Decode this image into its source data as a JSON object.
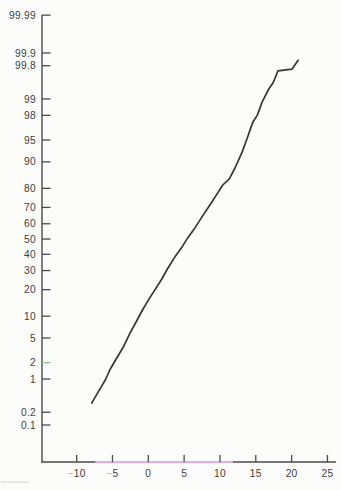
{
  "page": {
    "background": "#fcfcfa",
    "description_text": "normal probability plot, cumulative percent vs value"
  },
  "chart_data": {
    "type": "line",
    "title": "",
    "xlabel": "",
    "ylabel": "",
    "y_scale": "normal-probability (probit), percent",
    "x_axis": {
      "ticks": [
        -10,
        -5,
        0,
        5,
        10,
        15,
        20,
        25
      ],
      "range": [
        -14.8,
        26.2
      ]
    },
    "y_axis": {
      "tick_labels": [
        "99.99",
        "99.9",
        "99.8",
        "99",
        "98",
        "95",
        "90",
        "80",
        "70",
        "60",
        "50",
        "40",
        "30",
        "20",
        "10",
        "5",
        "2",
        "1",
        "0.2",
        "0.1"
      ],
      "range_percent": [
        0.02,
        99.993
      ]
    },
    "series": [
      {
        "name": "cumulative-percent-curve",
        "points": [
          [
            -7.9,
            0.32
          ],
          [
            -7.0,
            0.55
          ],
          [
            -6.0,
            0.96
          ],
          [
            -5.3,
            1.54
          ],
          [
            -4.4,
            2.4
          ],
          [
            -3.5,
            3.6
          ],
          [
            -2.55,
            5.9
          ],
          [
            -1.7,
            8.4
          ],
          [
            -0.9,
            11.6
          ],
          [
            0.0,
            15.5
          ],
          [
            0.9,
            19.8
          ],
          [
            1.8,
            24.8
          ],
          [
            2.75,
            31.5
          ],
          [
            3.7,
            38.2
          ],
          [
            4.6,
            44.0
          ],
          [
            5.5,
            50.7
          ],
          [
            6.5,
            57.3
          ],
          [
            7.5,
            64.3
          ],
          [
            8.6,
            71.4
          ],
          [
            9.6,
            77.3
          ],
          [
            10.4,
            81.5
          ],
          [
            11.3,
            84.1
          ],
          [
            12.1,
            88.1
          ],
          [
            13.1,
            92.6
          ],
          [
            13.8,
            95.3
          ],
          [
            14.2,
            96.5
          ],
          [
            14.6,
            97.4
          ],
          [
            15.2,
            98.0
          ],
          [
            15.9,
            98.86
          ],
          [
            16.3,
            99.12
          ],
          [
            16.8,
            99.36
          ],
          [
            17.4,
            99.52
          ],
          [
            18.1,
            99.74
          ],
          [
            20.05,
            99.76
          ],
          [
            20.9,
            99.85
          ]
        ]
      }
    ],
    "colors": {
      "curve": "#363636",
      "axis": "#4a4a4a",
      "label": "#3d3d3d",
      "pink_axis_segment": "#e9aad8",
      "green_accent": "#8fc492",
      "artifact_gray": "#d8d8d4"
    },
    "accents": {
      "green_y_tick_label": "2",
      "green_minus_x_labels": [
        -10,
        -5
      ],
      "pink_axis_segment_x_range": [
        -7.4,
        11.8
      ]
    },
    "legend": "none",
    "grid": "off"
  }
}
